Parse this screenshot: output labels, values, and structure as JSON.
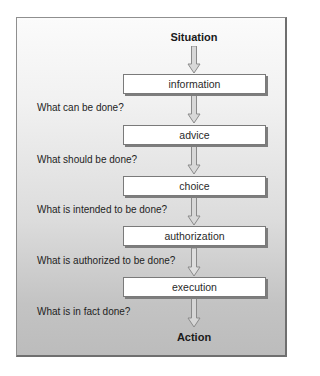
{
  "diagram": {
    "start": "Situation",
    "end": "Action",
    "stages": [
      {
        "label": "information"
      },
      {
        "label": "advice"
      },
      {
        "label": "choice"
      },
      {
        "label": "authorization"
      },
      {
        "label": "execution"
      }
    ],
    "questions": [
      "What can be done?",
      "What should be done?",
      "What is intended to be done?",
      "What is authorized to be done?",
      "What is in fact done?"
    ]
  },
  "colors": {
    "arrow_fill": "#d8d8d8",
    "arrow_stroke": "#8a8a8a",
    "box_fill": "#ffffff",
    "box_shadow": "#7d7d7d"
  }
}
